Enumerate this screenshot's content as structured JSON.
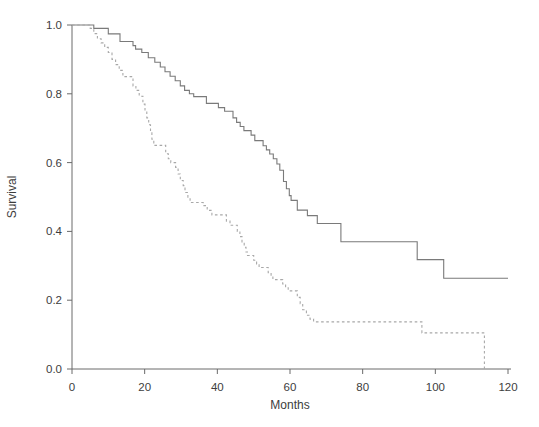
{
  "figure": {
    "background": "#ffffff",
    "width": 539,
    "height": 427
  },
  "chart_data": {
    "type": "line",
    "variant": "kaplan-meier-step",
    "title": "",
    "xlabel": "Months",
    "ylabel": "Survival",
    "xlim": [
      0,
      120
    ],
    "ylim": [
      0.0,
      1.0
    ],
    "xtick_labels": [
      "0",
      "20",
      "40",
      "60",
      "80",
      "100",
      "120"
    ],
    "ytick_labels": [
      "0.0",
      "0.2",
      "0.4",
      "0.6",
      "0.8",
      "1.0"
    ],
    "grid": false,
    "legend": {
      "visible": false
    },
    "colors": {
      "solid_series": "#7a7a7a",
      "dashed_series": "#a8a8a8",
      "axis": "#6a6a6a",
      "text": "#3d3d3d"
    },
    "series": [
      {
        "name": "upper curve (solid)",
        "line_style": "solid",
        "points": [
          [
            0,
            1.0
          ],
          [
            6,
            0.99
          ],
          [
            10,
            0.974
          ],
          [
            13.2,
            0.952
          ],
          [
            16.8,
            0.94
          ],
          [
            17.5,
            0.93
          ],
          [
            19.2,
            0.92
          ],
          [
            21,
            0.905
          ],
          [
            22.8,
            0.892
          ],
          [
            24.3,
            0.878
          ],
          [
            25.6,
            0.864
          ],
          [
            27,
            0.851
          ],
          [
            28.4,
            0.838
          ],
          [
            29.8,
            0.823
          ],
          [
            31,
            0.81
          ],
          [
            32.3,
            0.8
          ],
          [
            33.5,
            0.792
          ],
          [
            37,
            0.772
          ],
          [
            40.3,
            0.76
          ],
          [
            42,
            0.749
          ],
          [
            44.3,
            0.73
          ],
          [
            45.3,
            0.717
          ],
          [
            46.3,
            0.705
          ],
          [
            47.3,
            0.693
          ],
          [
            49.3,
            0.68
          ],
          [
            50.3,
            0.664
          ],
          [
            52.6,
            0.649
          ],
          [
            53.5,
            0.637
          ],
          [
            54.4,
            0.625
          ],
          [
            55.4,
            0.611
          ],
          [
            56.4,
            0.596
          ],
          [
            57.2,
            0.578
          ],
          [
            58.2,
            0.545
          ],
          [
            59,
            0.524
          ],
          [
            59.8,
            0.504
          ],
          [
            60.3,
            0.49
          ],
          [
            62,
            0.462
          ],
          [
            64.8,
            0.446
          ],
          [
            67.5,
            0.423
          ],
          [
            74,
            0.37
          ],
          [
            95,
            0.318
          ],
          [
            102.3,
            0.264
          ],
          [
            120,
            0.264
          ]
        ]
      },
      {
        "name": "lower curve (dashed)",
        "line_style": "dashed",
        "dash_pattern": [
          2.6,
          2.6
        ],
        "points": [
          [
            0,
            1.0
          ],
          [
            5,
            0.99
          ],
          [
            6,
            0.975
          ],
          [
            7,
            0.96
          ],
          [
            8,
            0.948
          ],
          [
            9,
            0.935
          ],
          [
            10,
            0.92
          ],
          [
            11,
            0.9
          ],
          [
            12,
            0.885
          ],
          [
            13,
            0.868
          ],
          [
            14,
            0.85
          ],
          [
            16.8,
            0.823
          ],
          [
            17.6,
            0.81
          ],
          [
            18.5,
            0.793
          ],
          [
            19.5,
            0.77
          ],
          [
            20.1,
            0.75
          ],
          [
            20.6,
            0.73
          ],
          [
            21.1,
            0.71
          ],
          [
            21.6,
            0.69
          ],
          [
            22,
            0.668
          ],
          [
            22.5,
            0.65
          ],
          [
            25.8,
            0.626
          ],
          [
            26.5,
            0.611
          ],
          [
            27.2,
            0.6
          ],
          [
            28.5,
            0.586
          ],
          [
            29.2,
            0.567
          ],
          [
            29.8,
            0.548
          ],
          [
            30.6,
            0.533
          ],
          [
            31.1,
            0.513
          ],
          [
            31.9,
            0.495
          ],
          [
            32.5,
            0.484
          ],
          [
            36.1,
            0.475
          ],
          [
            37.2,
            0.461
          ],
          [
            38.5,
            0.448
          ],
          [
            42.5,
            0.43
          ],
          [
            43.5,
            0.418
          ],
          [
            45.5,
            0.4
          ],
          [
            46.2,
            0.385
          ],
          [
            46.8,
            0.368
          ],
          [
            47.4,
            0.354
          ],
          [
            47.9,
            0.34
          ],
          [
            48.3,
            0.33
          ],
          [
            50,
            0.316
          ],
          [
            50.8,
            0.305
          ],
          [
            51.5,
            0.295
          ],
          [
            54,
            0.28
          ],
          [
            54.8,
            0.27
          ],
          [
            55.3,
            0.26
          ],
          [
            58,
            0.247
          ],
          [
            58.8,
            0.236
          ],
          [
            59.5,
            0.227
          ],
          [
            62,
            0.208
          ],
          [
            62.8,
            0.19
          ],
          [
            63.5,
            0.172
          ],
          [
            64.5,
            0.156
          ],
          [
            65.5,
            0.145
          ],
          [
            66.5,
            0.137
          ],
          [
            96.3,
            0.105
          ],
          [
            113.5,
            0.0
          ]
        ]
      }
    ]
  }
}
